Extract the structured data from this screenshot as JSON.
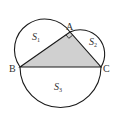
{
  "diagram": {
    "points": {
      "A": {
        "label": "A",
        "x": 70,
        "y": 32
      },
      "B": {
        "label": "B",
        "x": 20,
        "y": 67
      },
      "C": {
        "label": "C",
        "x": 101,
        "y": 67
      }
    },
    "regions": {
      "S1": {
        "label": "S",
        "sub": "1"
      },
      "S2": {
        "label": "S",
        "sub": "2"
      },
      "S3": {
        "label": "S",
        "sub": "3"
      }
    },
    "right_angle_at": "A",
    "colors": {
      "stroke": "#1a1a1a",
      "triangle_fill": "#d0d0d0",
      "background": "#ffffff"
    }
  }
}
